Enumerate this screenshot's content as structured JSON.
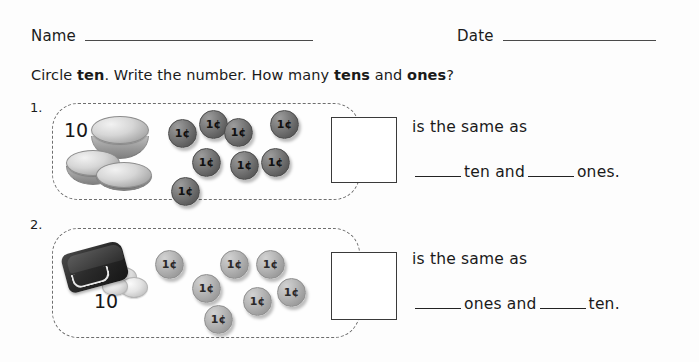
{
  "header": {
    "name_label": "Name",
    "date_label": "Date"
  },
  "instructions": {
    "part1": "Circle ",
    "bold1": "ten",
    "part2": ".  Write the number.  How many ",
    "bold2": "tens",
    "part3": " and ",
    "bold3": "ones",
    "part4": "?"
  },
  "problems": [
    {
      "number": "1.",
      "group_label": "10",
      "group_type": "coin-stack",
      "loose_coin_label": "1¢",
      "loose_coin_count": 8,
      "answer_box_value": "",
      "same_as_text": "is the same as",
      "fill_prefix": "",
      "fill_word1": "ten  and",
      "fill_word2": "ones.",
      "coins": [
        {
          "x": 168,
          "y": 119,
          "size": 27
        },
        {
          "x": 199,
          "y": 110,
          "size": 27
        },
        {
          "x": 224,
          "y": 118,
          "size": 27
        },
        {
          "x": 270,
          "y": 110,
          "size": 27
        },
        {
          "x": 192,
          "y": 148,
          "size": 27
        },
        {
          "x": 230,
          "y": 151,
          "size": 27
        },
        {
          "x": 261,
          "y": 148,
          "size": 27
        },
        {
          "x": 171,
          "y": 177,
          "size": 27
        }
      ]
    },
    {
      "number": "2.",
      "group_label": "10",
      "group_type": "purse",
      "loose_coin_label": "1¢",
      "loose_coin_count": 7,
      "answer_box_value": "",
      "same_as_text": "is the same as",
      "fill_prefix": "",
      "fill_word1": "ones  and",
      "fill_word2": "ten.",
      "coins": [
        {
          "x": 155,
          "y": 250,
          "size": 27
        },
        {
          "x": 220,
          "y": 250,
          "size": 27
        },
        {
          "x": 256,
          "y": 250,
          "size": 27
        },
        {
          "x": 192,
          "y": 274,
          "size": 27
        },
        {
          "x": 277,
          "y": 278,
          "size": 27
        },
        {
          "x": 243,
          "y": 287,
          "size": 27
        },
        {
          "x": 204,
          "y": 305,
          "size": 27
        }
      ]
    }
  ],
  "colors": {
    "page_background": "#fdfdfd",
    "ink": "#1a1a1a",
    "dashed_border": "#6e6e6e",
    "answer_box_border": "#3a3a3a",
    "rule_line": "#4a4a4a",
    "penny_dark": "#5e5e5e",
    "penny_light": "#9e9e9e",
    "purse_dark": "#2b2b2b"
  }
}
